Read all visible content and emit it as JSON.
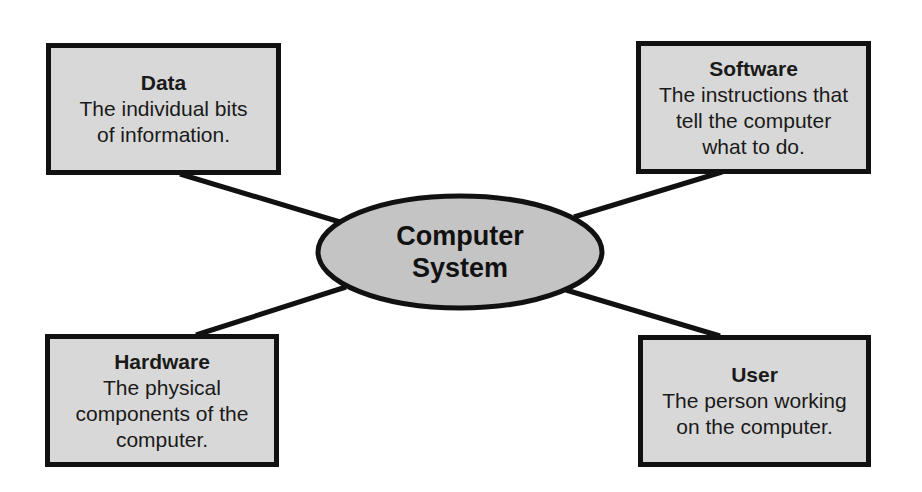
{
  "diagram": {
    "center": {
      "label": "Computer\nSystem",
      "fill": "#c4c4c4",
      "stroke": "#111111"
    },
    "nodes": [
      {
        "id": "data",
        "title": "Data",
        "description": "The individual bits\nof information."
      },
      {
        "id": "software",
        "title": "Software",
        "description": "The instructions that\ntell the computer\nwhat to do."
      },
      {
        "id": "hardware",
        "title": "Hardware",
        "description": "The physical\ncomponents of the\ncomputer."
      },
      {
        "id": "user",
        "title": "User",
        "description": "The person working\non the computer."
      }
    ],
    "box_fill": "#d8d8d8",
    "line_color": "#111111"
  }
}
